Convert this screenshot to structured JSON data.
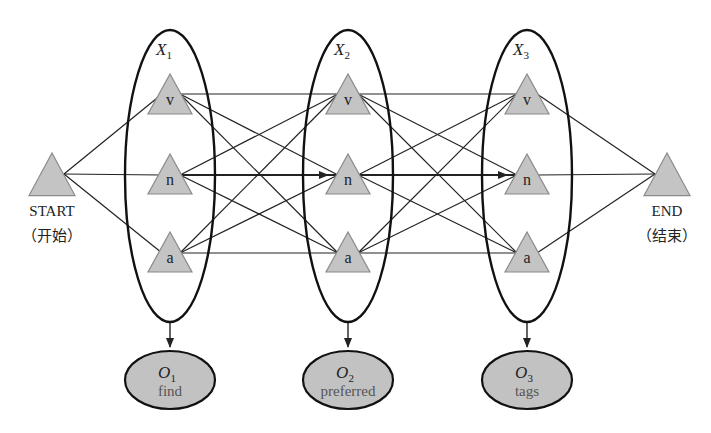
{
  "start": {
    "label": "START",
    "sublabel": "（开始）"
  },
  "end": {
    "label": "END",
    "sublabel": "（结束）"
  },
  "states": [
    "v",
    "n",
    "a"
  ],
  "hidden_variables": [
    {
      "name": "X",
      "sub": "1"
    },
    {
      "name": "X",
      "sub": "2"
    },
    {
      "name": "X",
      "sub": "3"
    }
  ],
  "observations": [
    {
      "name": "O",
      "sub": "1",
      "word": "find"
    },
    {
      "name": "O",
      "sub": "2",
      "word": "preferred"
    },
    {
      "name": "O",
      "sub": "3",
      "word": "tags"
    }
  ],
  "highlighted_path": [
    "n",
    "n",
    "n"
  ],
  "colors": {
    "node_fill": "#c4c4c4",
    "node_stroke": "#8a8a8a",
    "obs_fill": "#c2c2c2",
    "line": "#222222"
  }
}
